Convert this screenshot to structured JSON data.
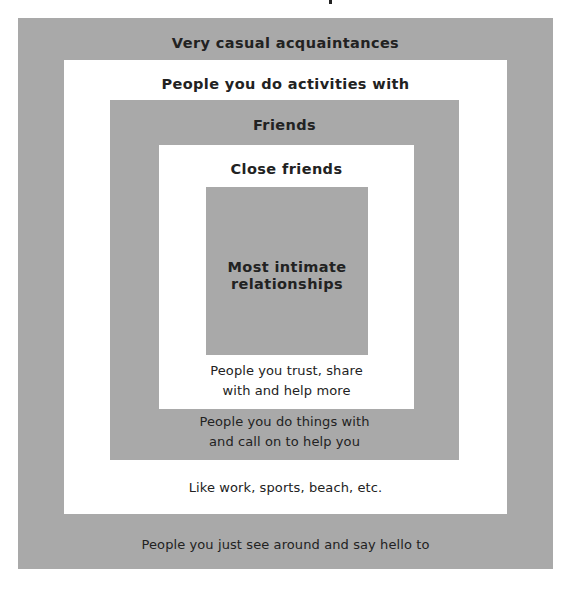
{
  "diagram": {
    "type": "nested-squares",
    "colors": {
      "gray": "#a9a9a9",
      "white": "#ffffff",
      "text": "#222222"
    },
    "levels": [
      {
        "title": "Very casual acquaintances",
        "description": "People you just see around and say hello to"
      },
      {
        "title": "People you do activities with",
        "description": "Like work, sports, beach, etc."
      },
      {
        "title": "Friends",
        "description_lines": [
          "People you do things with",
          "and call on to help you"
        ]
      },
      {
        "title": "Close friends",
        "description_lines": [
          "People you trust, share",
          "with and help more"
        ]
      },
      {
        "title_lines": [
          "Most intimate",
          "relationships"
        ]
      }
    ]
  }
}
